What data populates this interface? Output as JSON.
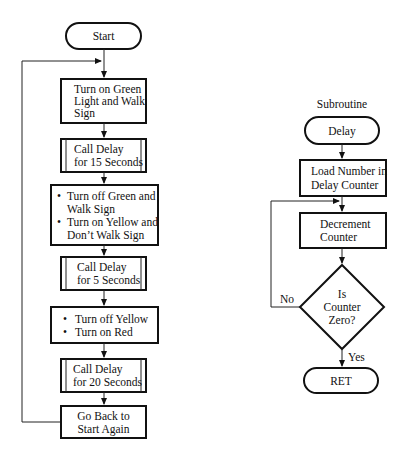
{
  "main_flow": {
    "start": "Start",
    "steps": [
      {
        "type": "process",
        "lines": [
          "Turn on Green",
          "Light and Walk",
          "Sign"
        ]
      },
      {
        "type": "subroutine",
        "lines": [
          "Call Delay",
          "for 15 Seconds"
        ]
      },
      {
        "type": "process-bullets",
        "lines": [
          "Turn off Green and",
          "Walk Sign",
          "Turn on Yellow and",
          "Don’t Walk Sign"
        ],
        "bullets": [
          0,
          2
        ]
      },
      {
        "type": "subroutine",
        "lines": [
          "Call Delay",
          "for 5 Seconds"
        ]
      },
      {
        "type": "process-bullets",
        "lines": [
          "Turn off Yellow",
          "Turn on Red"
        ],
        "bullets": [
          0,
          1
        ]
      },
      {
        "type": "subroutine",
        "lines": [
          "Call Delay",
          "for 20 Seconds"
        ]
      },
      {
        "type": "process",
        "lines": [
          "Go Back to",
          "Start Again"
        ]
      }
    ]
  },
  "subroutine": {
    "label": "Subroutine",
    "entry": "Delay",
    "load": [
      "Load Number in",
      "Delay Counter"
    ],
    "decrement": [
      "Decrement",
      "Counter"
    ],
    "decision": [
      "Is",
      "Counter",
      "Zero?"
    ],
    "no_label": "No",
    "yes_label": "Yes",
    "exit": "RET"
  }
}
